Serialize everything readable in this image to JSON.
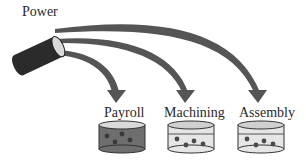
{
  "diagram": {
    "source": {
      "label": "Power"
    },
    "targets": [
      {
        "label": "Payroll",
        "fill_level": "full"
      },
      {
        "label": "Machining",
        "fill_level": "partial"
      },
      {
        "label": "Assembly",
        "fill_level": "partial"
      }
    ],
    "colors": {
      "arrow": "#555555",
      "source_body": "#2b2b2b",
      "source_face": "#d9d9d9",
      "full_container": "#6e6e6e",
      "partial_container": "#dcdcdc",
      "dot": "#4a4a4a"
    }
  }
}
